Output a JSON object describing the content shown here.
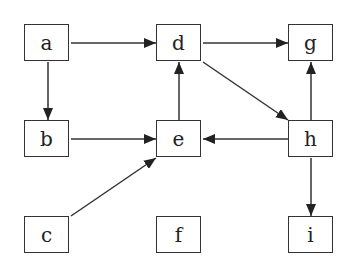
{
  "diagram": {
    "type": "directed-graph",
    "nodes": [
      {
        "id": "a",
        "label": "a",
        "x": 24,
        "y": 24
      },
      {
        "id": "d",
        "label": "d",
        "x": 156,
        "y": 24
      },
      {
        "id": "g",
        "label": "g",
        "x": 288,
        "y": 24
      },
      {
        "id": "b",
        "label": "b",
        "x": 24,
        "y": 120
      },
      {
        "id": "e",
        "label": "e",
        "x": 156,
        "y": 120
      },
      {
        "id": "h",
        "label": "h",
        "x": 288,
        "y": 120
      },
      {
        "id": "c",
        "label": "c",
        "x": 24,
        "y": 216
      },
      {
        "id": "f",
        "label": "f",
        "x": 156,
        "y": 216
      },
      {
        "id": "i",
        "label": "i",
        "x": 288,
        "y": 216
      }
    ],
    "edges": [
      {
        "from": "a",
        "to": "d"
      },
      {
        "from": "a",
        "to": "b"
      },
      {
        "from": "d",
        "to": "g"
      },
      {
        "from": "d",
        "to": "h"
      },
      {
        "from": "b",
        "to": "e"
      },
      {
        "from": "e",
        "to": "d"
      },
      {
        "from": "h",
        "to": "e"
      },
      {
        "from": "h",
        "to": "g"
      },
      {
        "from": "h",
        "to": "i"
      },
      {
        "from": "c",
        "to": "e"
      }
    ]
  }
}
